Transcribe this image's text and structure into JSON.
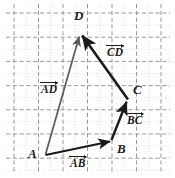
{
  "figure": {
    "width": 175,
    "height": 178,
    "background": "#ffffff"
  },
  "grid": {
    "major_color": "#9a9a9a",
    "minor_color": "#b9b9b9",
    "x_lines": [
      14,
      38.5,
      63,
      87.5,
      112,
      136.5,
      161
    ],
    "y_lines": [
      13,
      37.2,
      61.4,
      85.6,
      109.8,
      134,
      158.2
    ],
    "spacing": 24.4,
    "style": "dashed-dotted"
  },
  "points": {
    "A": {
      "label": "A",
      "x": 45,
      "y": 155,
      "label_x": 28,
      "label_y": 148
    },
    "B": {
      "label": "B",
      "x": 112,
      "y": 140,
      "label_x": 116,
      "label_y": 143
    },
    "C": {
      "label": "C",
      "x": 128,
      "y": 100,
      "label_x": 133,
      "label_y": 84
    },
    "D": {
      "label": "D",
      "x": 80,
      "y": 33,
      "label_x": 75,
      "label_y": 10
    }
  },
  "vectors": [
    {
      "name": "AB",
      "label": "AB",
      "from": "A",
      "to": "B",
      "color": "#1a1a1a",
      "stroke_width": 2.1,
      "label_x": 71,
      "label_y": 158
    },
    {
      "name": "BC",
      "label": "BC",
      "from": "B",
      "to": "C",
      "color": "#1a1a1a",
      "stroke_width": 2.3,
      "label_x": 128,
      "label_y": 115
    },
    {
      "name": "CD",
      "label": "CD",
      "from": "C",
      "to": "D",
      "color": "#1a1a1a",
      "stroke_width": 2.6,
      "label_x": 108,
      "label_y": 47
    },
    {
      "name": "AD",
      "label": "AD",
      "from": "A",
      "to": "D",
      "color": "#5a5a5a",
      "stroke_width": 1.7,
      "label_x": 41,
      "label_y": 83
    }
  ],
  "colors": {
    "ink": "#1a1a1a",
    "resultant": "#5a5a5a",
    "grid": "#9a9a9a",
    "paper": "#ffffff"
  }
}
